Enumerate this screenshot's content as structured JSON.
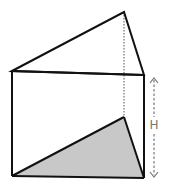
{
  "figure": {
    "type": "triangular-prism",
    "colors": {
      "edge": "#111111",
      "base_fill": "#c8c8c8",
      "dimension": "#777777",
      "background": "#ffffff"
    },
    "dimension_label": "H"
  }
}
